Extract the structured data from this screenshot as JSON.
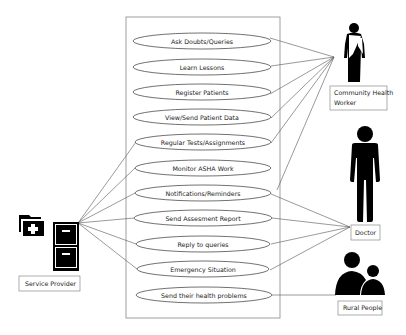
{
  "diagram": {
    "type": "use-case",
    "system_boundary": {
      "x": 126,
      "y": 17,
      "width": 154,
      "height": 301
    },
    "use_cases": [
      {
        "id": "uc1",
        "label": "Ask Doubts/Queries",
        "cy": 41
      },
      {
        "id": "uc2",
        "label": "Learn Lessons",
        "cy": 67
      },
      {
        "id": "uc3",
        "label": "Register Patients",
        "cy": 92
      },
      {
        "id": "uc4",
        "label": "View/Send Patient Data",
        "cy": 117
      },
      {
        "id": "uc5",
        "label": "Regular Tests/Assignments",
        "cy": 142
      },
      {
        "id": "uc6",
        "label": "Monitor ASHA Work",
        "cy": 168
      },
      {
        "id": "uc7",
        "label": "Notifications/Reminders",
        "cy": 193
      },
      {
        "id": "uc8",
        "label": "Send Assesment Report",
        "cy": 218
      },
      {
        "id": "uc9",
        "label": "Reply to queries",
        "cy": 244
      },
      {
        "id": "uc10",
        "label": "Emergency Situation",
        "cy": 269
      },
      {
        "id": "uc11",
        "label": "Send their health problems",
        "cy": 295
      }
    ],
    "actors": {
      "service_provider": {
        "label": "Service Provider",
        "icon": "medical-file-cabinet-icon"
      },
      "community_health_worker": {
        "label_line1": "Community Health",
        "label_line2": "Worker",
        "icon": "woman-in-saree-icon"
      },
      "doctor": {
        "label": "Doctor",
        "icon": "person-standing-icon"
      },
      "rural_people": {
        "label": "Rural People",
        "icon": "people-group-icon"
      }
    },
    "associations": {
      "community_health_worker": [
        "uc1",
        "uc2",
        "uc3",
        "uc4",
        "uc5",
        "uc7"
      ],
      "service_provider": [
        "uc5",
        "uc6",
        "uc7",
        "uc8",
        "uc9",
        "uc10"
      ],
      "doctor": [
        "uc7",
        "uc8",
        "uc9",
        "uc10"
      ],
      "rural_people": [
        "uc11"
      ]
    },
    "colors": {
      "figure": "#000000",
      "line": "#555555",
      "border": "#888888"
    }
  }
}
